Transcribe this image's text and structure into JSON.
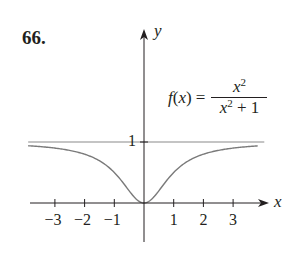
{
  "problem": {
    "number_label": "66."
  },
  "chart_data": {
    "type": "line",
    "title": "",
    "function_label": {
      "lhs": "f(x) =",
      "numerator": "x²",
      "denominator": "x² + 1"
    },
    "series": [
      {
        "name": "f(x) = x^2/(x^2+1)",
        "x": [
          -3.9,
          -3.5,
          -3,
          -2.5,
          -2,
          -1.5,
          -1,
          -0.75,
          -0.5,
          -0.25,
          0,
          0.25,
          0.5,
          0.75,
          1,
          1.5,
          2,
          2.5,
          3,
          3.5,
          3.83
        ],
        "values": [
          0.938,
          0.925,
          0.9,
          0.862,
          0.8,
          0.692,
          0.5,
          0.36,
          0.2,
          0.059,
          0,
          0.059,
          0.2,
          0.36,
          0.5,
          0.692,
          0.8,
          0.862,
          0.9,
          0.925,
          0.936
        ]
      },
      {
        "name": "asymptote y = 1",
        "x": [
          -3.9,
          4.05
        ],
        "values": [
          1,
          1
        ]
      }
    ],
    "xlabel": "x",
    "ylabel": "y",
    "x_ticks": [
      -3,
      -2,
      -1,
      1,
      2,
      3
    ],
    "x_tick_labels": [
      "−3",
      "−2",
      "−1",
      "1",
      "2",
      "3"
    ],
    "y_ticks": [
      1
    ],
    "y_tick_labels": [
      "1"
    ],
    "xlim": [
      -3.9,
      4.2
    ],
    "ylim": [
      -0.6,
      2.85
    ],
    "grid": false,
    "legend": "none",
    "colors": {
      "curve": "#7a7a7a",
      "asymptote": "#8a8a8a",
      "axes": "#231f20"
    }
  }
}
